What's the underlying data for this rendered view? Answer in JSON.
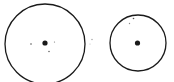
{
  "diagram": {
    "width": 174,
    "height": 82,
    "stroke_color": "#1a1a1a",
    "background": "#ffffff",
    "circles": [
      {
        "id": "left-circle",
        "cx": 45,
        "cy": 44,
        "r": 40,
        "center_dot": {
          "cx": 45,
          "cy": 43,
          "r": 2.6
        },
        "small_dots": [
          {
            "cx": 31,
            "cy": 44,
            "r": 0.8,
            "color": "#555555"
          },
          {
            "cx": 54.5,
            "cy": 42,
            "r": 0.6,
            "color": "#777777"
          },
          {
            "cx": 49,
            "cy": 51.5,
            "r": 0.8,
            "color": "#666666"
          }
        ]
      },
      {
        "id": "right-circle",
        "cx": 138,
        "cy": 43,
        "r": 28,
        "center_dot": {
          "cx": 137.5,
          "cy": 43,
          "r": 2.6
        },
        "small_dots": [
          {
            "cx": 133.5,
            "cy": 18.5,
            "r": 0.8,
            "color": "#555555"
          },
          {
            "cx": 129.5,
            "cy": 23.5,
            "r": 0.7,
            "color": "#888888"
          }
        ]
      }
    ],
    "stray_marks": [
      {
        "cx": 92,
        "cy": 39.5,
        "r": 0.7,
        "color": "#999999"
      },
      {
        "cx": 90,
        "cy": 44,
        "r": 0.6,
        "color": "#bbbbbb"
      }
    ]
  }
}
